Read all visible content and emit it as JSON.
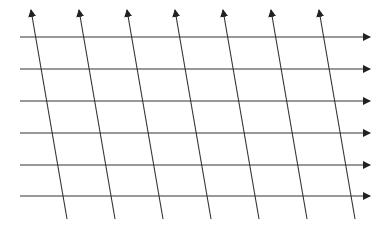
{
  "diagram": {
    "type": "skewed-grid-of-arrows",
    "background": "#ffffff",
    "stroke_color": "#333333",
    "horizontal_arrows": {
      "count": 6,
      "x_start": 20,
      "x_end": 370,
      "y_positions": [
        37,
        69,
        101,
        133,
        165,
        196
      ],
      "direction": "right"
    },
    "slanted_arrows": {
      "count": 7,
      "top_x": [
        31,
        79,
        127,
        175,
        223,
        271,
        319
      ],
      "top_y": 10,
      "bottom_x": [
        67,
        115,
        163,
        211,
        259,
        307,
        355
      ],
      "bottom_y": 219,
      "direction": "up"
    }
  }
}
